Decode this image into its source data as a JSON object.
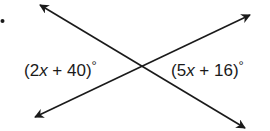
{
  "diagram": {
    "type": "intersecting-lines",
    "bullet": "•",
    "lines": [
      {
        "name": "line-1",
        "from": [
          40,
          5
        ],
        "to": [
          245,
          128
        ]
      },
      {
        "name": "line-2",
        "from": [
          35,
          117
        ],
        "to": [
          250,
          15
        ]
      }
    ],
    "intersection": [
      141,
      66
    ],
    "angles": [
      {
        "position": "left",
        "open": "(",
        "coef": "2",
        "variable": "x",
        "operator": " + ",
        "constant": "40",
        "close": ")",
        "degree": "°"
      },
      {
        "position": "right",
        "open": "(",
        "coef": "5",
        "variable": "x",
        "operator": " + ",
        "constant": "16",
        "close": ")",
        "degree": "°"
      }
    ],
    "colors": {
      "line": "#1a1a1a",
      "background": "#ffffff"
    }
  }
}
